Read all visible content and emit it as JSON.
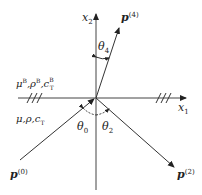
{
  "diagram": {
    "axes": {
      "x1": {
        "label": "x",
        "sub": "1"
      },
      "x2": {
        "label": "x",
        "sub": "2"
      }
    },
    "vectors": [
      {
        "id": "p4",
        "label": "p",
        "sup": "(4)"
      },
      {
        "id": "p0",
        "label": "p",
        "sup": "(0)"
      },
      {
        "id": "p2",
        "label": "p",
        "sup": "(2)"
      }
    ],
    "angles": [
      {
        "id": "theta4",
        "label": "θ",
        "sub": "4"
      },
      {
        "id": "theta0",
        "label": "θ",
        "sub": "0"
      },
      {
        "id": "theta2",
        "label": "θ",
        "sub": "2"
      }
    ],
    "media": {
      "upper": {
        "mu": "μ",
        "rho": "ρ",
        "c": "c",
        "c_sub": "T",
        "sup": "B",
        "sep": ","
      },
      "lower": {
        "mu": "μ",
        "rho": "ρ",
        "c": "c",
        "c_sub": "T",
        "sep": ","
      }
    },
    "colors": {
      "line": "#333333",
      "text": "#222222",
      "background": "#ffffff"
    }
  }
}
